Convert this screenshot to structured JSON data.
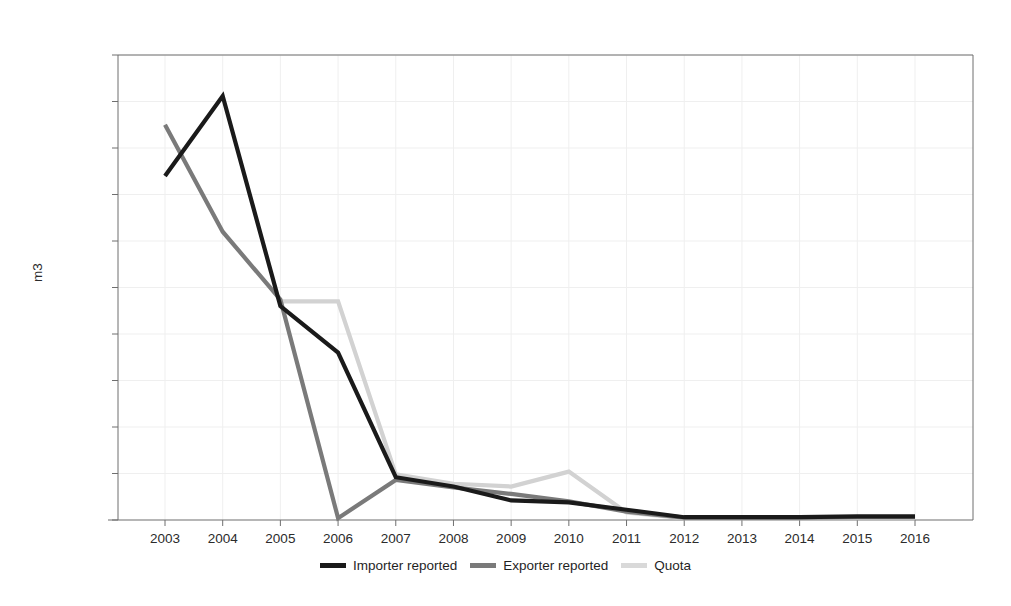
{
  "chart_data": {
    "type": "line",
    "title": "",
    "subtitle": "",
    "xlabel": "",
    "ylabel": "m3",
    "categories": [
      "2003",
      "2004",
      "2005",
      "2006",
      "2007",
      "2008",
      "2009",
      "2010",
      "2011",
      "2012",
      "2013",
      "2014",
      "2015",
      "2016"
    ],
    "x": [
      2003,
      2004,
      2005,
      2006,
      2007,
      2008,
      2009,
      2010,
      2011,
      2012,
      2013,
      2014,
      2015,
      2016
    ],
    "xlim": [
      2003,
      2016
    ],
    "ylim": [
      0,
      50000
    ],
    "ytick_labels": [
      "0",
      "5,000",
      "10,000",
      "15,000",
      "20,000",
      "25,000",
      "30,000",
      "35,000",
      "40,000",
      "45,000",
      "50,000"
    ],
    "ytick_values": [
      0,
      5000,
      10000,
      15000,
      20000,
      25000,
      30000,
      35000,
      40000,
      45000,
      50000
    ],
    "grid": true,
    "legend_position": "bottom",
    "series": [
      {
        "name": "Importer reported",
        "color": "#1a1a1a",
        "values": [
          37000,
          45600,
          23000,
          18000,
          4600,
          3600,
          2100,
          1900,
          1100,
          300,
          300,
          300,
          400,
          400
        ]
      },
      {
        "name": "Exporter reported",
        "color": "#7a7a7a",
        "values": [
          42500,
          31000,
          23700,
          200,
          4300,
          3500,
          2800,
          2000,
          900,
          250,
          250,
          250,
          300,
          300
        ]
      },
      {
        "name": "Quota",
        "color": "#d2d2d2",
        "values": [
          null,
          null,
          23500,
          23500,
          4900,
          3900,
          3600,
          5200,
          800,
          200,
          200,
          200,
          200,
          200
        ]
      }
    ]
  },
  "legend": {
    "items": [
      {
        "label": "Importer reported",
        "color": "#1a1a1a"
      },
      {
        "label": "Exporter reported",
        "color": "#7a7a7a"
      },
      {
        "label": "Quota",
        "color": "#d9d9d9"
      }
    ]
  },
  "axes": {
    "y_axis_title": "m3"
  },
  "style": {
    "frame_color": "#6f6f6f",
    "grid_color": "#efefef",
    "text_color": "#2b2b2b",
    "background": "#ffffff"
  }
}
